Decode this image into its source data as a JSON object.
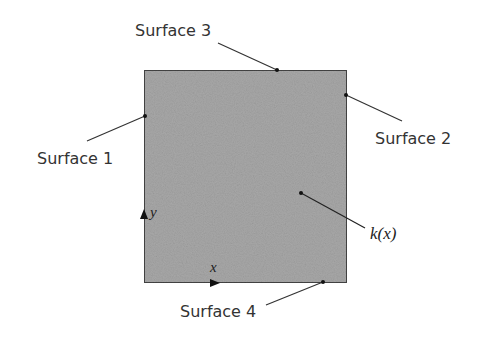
{
  "diagram": {
    "type": "2D conduction domain with spatially varying conductivity",
    "square": {
      "fill": "#a6a6a6",
      "stroke": "#444444"
    },
    "labels": {
      "surface1": "Surface 1",
      "surface2": "Surface 2",
      "surface3": "Surface 3",
      "surface4": "Surface 4",
      "conductivity": "k(x)",
      "x_axis": "x",
      "y_axis": "y"
    }
  }
}
